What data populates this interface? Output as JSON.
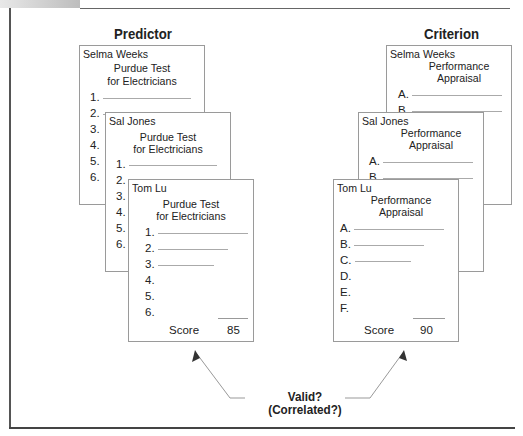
{
  "headings": {
    "predictor": "Predictor",
    "criterion": "Criterion"
  },
  "predictor_cards": [
    {
      "name": "Selma Weeks",
      "title_line1": "Purdue Test",
      "title_line2": "for Electricians",
      "items": [
        "1.",
        "2.",
        "3.",
        "4.",
        "5.",
        "6."
      ]
    },
    {
      "name": "Sal Jones",
      "title_line1": "Purdue Test",
      "title_line2": "for Electricians",
      "items": [
        "1.",
        "2.",
        "3.",
        "4.",
        "5.",
        "6."
      ]
    },
    {
      "name": "Tom Lu",
      "title_line1": "Purdue Test",
      "title_line2": "for Electricians",
      "items": [
        "1.",
        "2.",
        "3.",
        "4.",
        "5.",
        "6."
      ],
      "score_label": "Score",
      "score_value": "85"
    }
  ],
  "criterion_cards": [
    {
      "name": "Selma Weeks",
      "title_line1": "Performance",
      "title_line2": "Appraisal",
      "items": [
        "A.",
        "B."
      ]
    },
    {
      "name": "Sal Jones",
      "title_line1": "Performance",
      "title_line2": "Appraisal",
      "items": [
        "A.",
        "B."
      ]
    },
    {
      "name": "Tom Lu",
      "title_line1": "Performance",
      "title_line2": "Appraisal",
      "items": [
        "A.",
        "B.",
        "C.",
        "D.",
        "E.",
        "F."
      ],
      "score_label": "Score",
      "score_value": "90"
    }
  ],
  "question": {
    "line1": "Valid?",
    "line2": "(Correlated?)"
  },
  "colors": {
    "frame": "#555555",
    "card_border": "#9a9a9a",
    "arrow": "#888888"
  }
}
